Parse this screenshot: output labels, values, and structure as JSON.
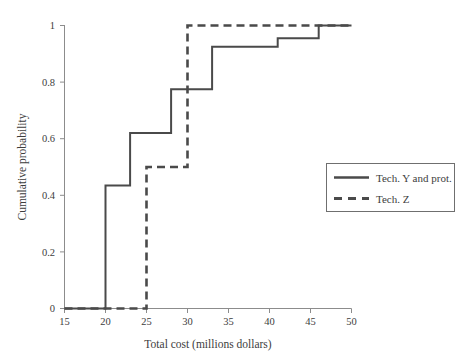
{
  "chart_data": {
    "type": "line",
    "title": "",
    "xlabel": "Total cost (millions dollars)",
    "ylabel": "Cumulative probability",
    "xlim": [
      15,
      50
    ],
    "ylim": [
      0,
      1
    ],
    "xticks": [
      "15",
      "20",
      "25",
      "30",
      "35",
      "40",
      "45",
      "50"
    ],
    "xtick_values": [
      15,
      20,
      25,
      30,
      35,
      40,
      45,
      50
    ],
    "yticks": [
      "0",
      "0.2",
      "0.4",
      "0.6",
      "0.8",
      "1"
    ],
    "ytick_values": [
      0,
      0.2,
      0.4,
      0.6,
      0.8,
      1
    ],
    "grid": false,
    "legend_position": "right-middle",
    "interpolation": "step-after",
    "series": [
      {
        "name": "Tech. Y and prot.",
        "style": "solid",
        "color": "#4a4a4a",
        "x": [
          15,
          20,
          20,
          23,
          23,
          28,
          28,
          33,
          33,
          41,
          41,
          46,
          46,
          50
        ],
        "y": [
          0,
          0,
          0.435,
          0.435,
          0.62,
          0.62,
          0.775,
          0.775,
          0.925,
          0.925,
          0.955,
          0.955,
          1,
          1
        ],
        "steps": [
          {
            "x": 15,
            "y": 0
          },
          {
            "x": 20,
            "y": 0.435
          },
          {
            "x": 23,
            "y": 0.62
          },
          {
            "x": 28,
            "y": 0.775
          },
          {
            "x": 33,
            "y": 0.925
          },
          {
            "x": 41,
            "y": 0.955
          },
          {
            "x": 46,
            "y": 1.0
          },
          {
            "x": 50,
            "y": 1.0
          }
        ]
      },
      {
        "name": "Tech. Z",
        "style": "dashed",
        "color": "#4a4a4a",
        "x": [
          15,
          25,
          25,
          30,
          30,
          50
        ],
        "y": [
          0,
          0,
          0.5,
          0.5,
          1,
          1
        ],
        "steps": [
          {
            "x": 15,
            "y": 0
          },
          {
            "x": 25,
            "y": 0.5
          },
          {
            "x": 30,
            "y": 1.0
          },
          {
            "x": 50,
            "y": 1.0
          }
        ]
      }
    ],
    "legend_entries": [
      {
        "label": "Tech. Y and prot.",
        "style": "solid"
      },
      {
        "label": "Tech. Z",
        "style": "dashed"
      }
    ]
  }
}
